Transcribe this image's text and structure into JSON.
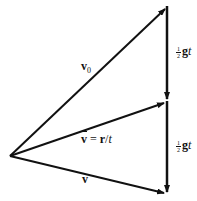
{
  "diagram": {
    "title": "",
    "vectors": [
      {
        "id": "v0",
        "label": "v",
        "subscript": "0",
        "from": [
          10,
          156
        ],
        "to": [
          166,
          8
        ]
      },
      {
        "id": "vbar",
        "label": "v̄ = r/t",
        "from": [
          10,
          156
        ],
        "to": [
          166,
          102
        ]
      },
      {
        "id": "v",
        "label": "v",
        "from": [
          10,
          156
        ],
        "to": [
          166,
          193
        ]
      },
      {
        "id": "half-gt-upper",
        "label": "½gt",
        "from": [
          166,
          8
        ],
        "to": [
          166,
          100
        ]
      },
      {
        "id": "half-gt-lower",
        "label": "½gt",
        "from": [
          166,
          102
        ],
        "to": [
          166,
          193
        ]
      }
    ],
    "labels": {
      "v0_main": "v",
      "v0_sub": "0",
      "vbar_v": "v",
      "vbar_eq": " = ",
      "vbar_r": "r",
      "vbar_slash": "/",
      "vbar_t": "t",
      "v_label": "v",
      "frac_num": "1",
      "frac_den": "2",
      "g": "g",
      "t": "t"
    },
    "colors": {
      "stroke": "#111111",
      "background": "#ffffff"
    }
  }
}
